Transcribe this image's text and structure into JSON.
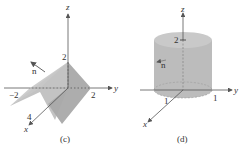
{
  "figures": [
    {
      "id": "c",
      "caption": "(c)",
      "axes": {
        "x": "x",
        "y": "y",
        "z": "z"
      },
      "ticks": {
        "z_top": "2",
        "y_neg": "−2",
        "y_pos": "2",
        "x_pos": "4"
      },
      "vector_label": "n",
      "surface": "folded plane (roof) with ridge at z = 2"
    },
    {
      "id": "d",
      "caption": "(d)",
      "axes": {
        "x": "x",
        "y": "y",
        "z": "z"
      },
      "ticks": {
        "z_top": "2",
        "x_pos": "1",
        "y_pos": "1"
      },
      "vector_label": "n",
      "surface": "cylinder of radius 1, height 2"
    }
  ],
  "colors": {
    "surface": "#b8b8b8",
    "surface_dark": "#a0a0a0",
    "axis": "#555555",
    "text": "#333333"
  }
}
